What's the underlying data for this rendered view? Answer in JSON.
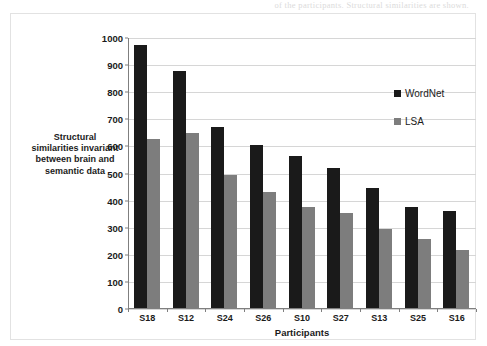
{
  "scan_artifact_text": "of the participants. Structural similarities are shown.",
  "chart_data": {
    "type": "bar",
    "title": "",
    "xlabel": "Participants",
    "ylabel": "Structural similarities invariant between brain and semantic data",
    "categories": [
      "S18",
      "S12",
      "S24",
      "S26",
      "S10",
      "S27",
      "S13",
      "S25",
      "S16"
    ],
    "series": [
      {
        "name": "WordNet",
        "color": "#1a1a1a",
        "values": [
          975,
          880,
          670,
          607,
          565,
          522,
          445,
          378,
          360
        ]
      },
      {
        "name": "LSA",
        "color": "#7d7d7d",
        "values": [
          627,
          648,
          495,
          430,
          378,
          355,
          297,
          260,
          218
        ]
      }
    ],
    "ylim": [
      0,
      1000
    ],
    "ytick_labels": [
      "1000",
      "900",
      "800",
      "700",
      "600",
      "500",
      "400",
      "300",
      "200",
      "100",
      "0"
    ],
    "ytick_values": [
      1000,
      900,
      800,
      700,
      600,
      500,
      400,
      300,
      200,
      100,
      0
    ],
    "grid": true,
    "legend_position": "inside-top-right"
  }
}
